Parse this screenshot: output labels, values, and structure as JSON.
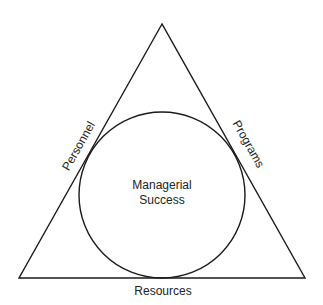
{
  "diagram": {
    "center_label": [
      "Managerial",
      "Success"
    ],
    "sides": {
      "left": "Personnel",
      "right": "Programs",
      "bottom": "Resources"
    },
    "stroke_color": "#1a1a1a",
    "text_color": "#222222"
  }
}
